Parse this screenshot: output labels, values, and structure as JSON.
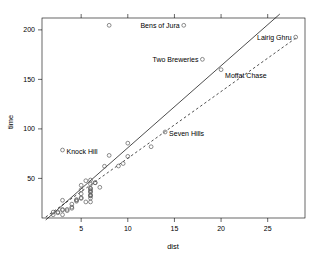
{
  "chart_data": {
    "type": "scatter",
    "title": "",
    "xlabel": "dist",
    "ylabel": "time",
    "xlim": [
      0.8,
      29.0
    ],
    "ylim": [
      10.0,
      212.0
    ],
    "xticks": [
      5,
      10,
      15,
      20,
      25
    ],
    "yticks": [
      50,
      100,
      150,
      200
    ],
    "grid": false,
    "legend": null,
    "point_marker": "open-circle",
    "points": [
      {
        "x": 2.5,
        "y": 16.083
      },
      {
        "x": 6.0,
        "y": 48.35
      },
      {
        "x": 6.0,
        "y": 33.65
      },
      {
        "x": 6.5,
        "y": 45.6
      },
      {
        "x": 7.5,
        "y": 62.267
      },
      {
        "x": 8.0,
        "y": 73.217
      },
      {
        "x": 8.0,
        "y": 204.617,
        "label": "Bens of Jura",
        "label_side": "left"
      },
      {
        "x": 16.0,
        "y": 204.617
      },
      {
        "x": 6.0,
        "y": 36.367
      },
      {
        "x": 5.0,
        "y": 29.75
      },
      {
        "x": 6.0,
        "y": 39.75
      },
      {
        "x": 28.0,
        "y": 192.667,
        "label": "Lairig Ghru",
        "label_side": "left"
      },
      {
        "x": 5.0,
        "y": 43.05
      },
      {
        "x": 9.5,
        "y": 65.0
      },
      {
        "x": 6.0,
        "y": 44.133
      },
      {
        "x": 4.5,
        "y": 26.933
      },
      {
        "x": 10.0,
        "y": 72.25
      },
      {
        "x": 6.0,
        "y": 36.567
      },
      {
        "x": 18.0,
        "y": 170.25,
        "label": "Two Breweries",
        "label_side": "left"
      },
      {
        "x": 4.5,
        "y": 28.567
      },
      {
        "x": 3.0,
        "y": 18.65
      },
      {
        "x": 5.5,
        "y": 26.217
      },
      {
        "x": 3.0,
        "y": 78.65,
        "label": "Knock Hill",
        "label_side": "right"
      },
      {
        "x": 3.5,
        "y": 17.417
      },
      {
        "x": 6.0,
        "y": 32.567
      },
      {
        "x": 2.0,
        "y": 15.95
      },
      {
        "x": 3.0,
        "y": 27.9
      },
      {
        "x": 4.0,
        "y": 19.833
      },
      {
        "x": 6.0,
        "y": 40.0
      },
      {
        "x": 5.0,
        "y": 34.433
      },
      {
        "x": 6.5,
        "y": 45.633
      },
      {
        "x": 20.0,
        "y": 159.833,
        "label": "Moffat Chase",
        "label_side": "right"
      },
      {
        "x": 5.0,
        "y": 38.5
      },
      {
        "x": 10.0,
        "y": 85.583
      },
      {
        "x": 6.0,
        "y": 32.383
      },
      {
        "x": 14.0,
        "y": 96.883,
        "label": "Seven Hills",
        "label_side": "right"
      },
      {
        "x": 3.0,
        "y": 13.3
      },
      {
        "x": 4.5,
        "y": 27.9
      },
      {
        "x": 5.5,
        "y": 47.633
      },
      {
        "x": 3.0,
        "y": 17.933
      },
      {
        "x": 3.5,
        "y": 18.683
      },
      {
        "x": 6.0,
        "y": 26.217
      },
      {
        "x": 2.0,
        "y": 13.3
      },
      {
        "x": 2.5,
        "y": 15.25
      },
      {
        "x": 6.0,
        "y": 38.0
      },
      {
        "x": 4.0,
        "y": 21.0
      },
      {
        "x": 9.0,
        "y": 62.5
      },
      {
        "x": 5.0,
        "y": 30.5
      },
      {
        "x": 7.0,
        "y": 41.0
      },
      {
        "x": 6.0,
        "y": 30.0
      },
      {
        "x": 4.0,
        "y": 24.0
      },
      {
        "x": 12.5,
        "y": 82.0
      }
    ],
    "lines": [
      {
        "name": "solid-fit-line",
        "style": "solid",
        "x1": 1.2,
        "y1": 8.0,
        "x2": 26.3,
        "y2": 216.0
      },
      {
        "name": "dashed-fit-line",
        "style": "dashed",
        "x1": 1.2,
        "y1": 11.0,
        "x2": 28.2,
        "y2": 193.0
      }
    ],
    "annotations": [
      {
        "text": "Bens of Jura",
        "x": 16.0,
        "y": 204.617,
        "anchor": "end",
        "dx": -4
      },
      {
        "text": "Lairig Ghru",
        "x": 28.0,
        "y": 192.667,
        "anchor": "end",
        "dx": -4
      },
      {
        "text": "Two Breweries",
        "x": 18.0,
        "y": 170.25,
        "anchor": "end",
        "dx": -4
      },
      {
        "text": "Moffat Chase",
        "x": 20.0,
        "y": 159.833,
        "anchor": "start",
        "dx": 4,
        "dy": 8
      },
      {
        "text": "Seven Hills",
        "x": 14.0,
        "y": 96.883,
        "anchor": "start",
        "dx": 4,
        "dy": 4
      },
      {
        "text": "Knock Hill",
        "x": 3.0,
        "y": 78.65,
        "anchor": "start",
        "dx": 4,
        "dy": 4
      }
    ]
  },
  "axes": {
    "x_label": "dist",
    "y_label": "time",
    "x_tick_labels": [
      "5",
      "10",
      "15",
      "20",
      "25"
    ],
    "y_tick_labels": [
      "50",
      "100",
      "150",
      "200"
    ]
  },
  "colors": {
    "foreground": "#000000",
    "background": "#ffffff",
    "point_stroke": "#5a5a5a",
    "line": "#000000"
  }
}
